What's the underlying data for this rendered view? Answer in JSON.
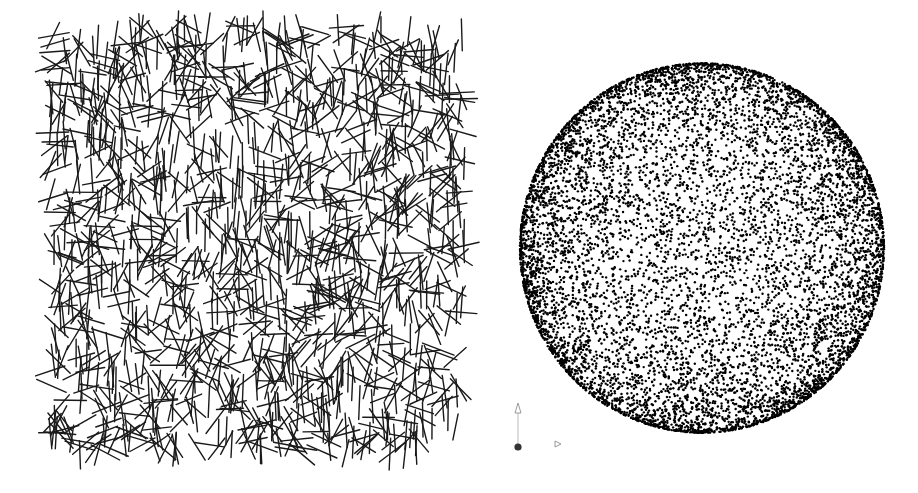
{
  "scene": {
    "background": "#ffffff",
    "width": 918,
    "height": 493
  },
  "line_field": {
    "label": "random-sticks",
    "region": {
      "x0": 50,
      "y0": 25,
      "x1": 465,
      "y1": 455
    },
    "count": 1500,
    "length": 30,
    "stroke_width": 1.4,
    "color": "#1a1a1a",
    "seed": 7
  },
  "sphere_points": {
    "label": "sphere-point-cloud",
    "center": {
      "x": 702,
      "y": 248
    },
    "radius": 182,
    "count": 9000,
    "dot_size": 2.4,
    "color": "#000000",
    "seed": 11
  },
  "axis_gizmo": {
    "y_axis_color": "#bbbbbb",
    "x_axis_color": "#bbbbbb",
    "origin_color": "#333333"
  }
}
